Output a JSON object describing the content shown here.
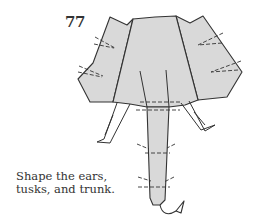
{
  "step": {
    "number": "77",
    "caption_lines": [
      "Shape the ears,",
      "tusks, and trunk."
    ]
  },
  "diagram": {
    "paper_color": "#d9d9d9",
    "line_color": "#333333",
    "parts": [
      "left-ear",
      "head",
      "right-ear",
      "trunk",
      "left-tusk",
      "right-tusk"
    ],
    "fold_indicators": [
      "valley-fold arrows on ears",
      "valley-fold lines on trunk",
      "fold lines at trunk base"
    ]
  }
}
